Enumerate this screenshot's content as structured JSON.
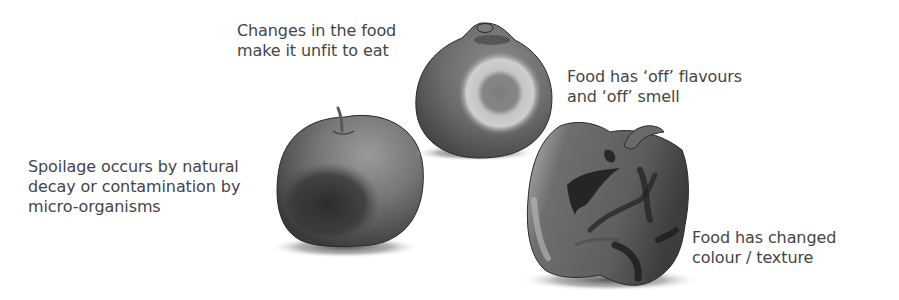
{
  "diagram": {
    "topic": "Food spoilage",
    "labels": {
      "unfit": {
        "lines": [
          "Changes in the food",
          "make it unfit to eat"
        ]
      },
      "off_flavours": {
        "lines": [
          "Food has ‘off’ flavours",
          "and ‘off’ smell"
        ]
      },
      "spoilage_cause": {
        "lines": [
          "Spoilage occurs by natural",
          "decay or contamination by",
          "micro-organisms"
        ]
      },
      "colour_texture": {
        "lines": [
          "Food has changed",
          "colour / texture"
        ]
      }
    },
    "illustrations": [
      {
        "name": "apple",
        "description": "Apple with a dark bruised/decaying patch"
      },
      {
        "name": "round-fruit",
        "description": "Round fruit with a pale mould ring around a darker spot"
      },
      {
        "name": "pepper",
        "description": "Wrinkled, shrivelled pepper with dark patches"
      }
    ],
    "colors": {
      "text": "#454545",
      "background": "#ffffff",
      "fruit_base": "#6e6e6e",
      "fruit_dark": "#2e2e2e",
      "mould_ring": "#c9c9c9"
    }
  }
}
